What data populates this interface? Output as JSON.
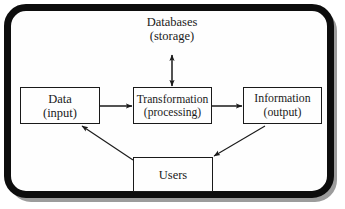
{
  "diagram": {
    "type": "flow-diagram",
    "background_color": "#fefefe",
    "frame_color": "#0d0d0d",
    "line_color": "#1a1a1a",
    "nodes": [
      {
        "id": "databases",
        "label_line1": "Databases",
        "label_line2": "(storage)",
        "boxed": false
      },
      {
        "id": "data",
        "label_line1": "Data",
        "label_line2": "(input)",
        "boxed": true
      },
      {
        "id": "transformation",
        "label_line1": "Transformation",
        "label_line2": "(processing)",
        "boxed": true
      },
      {
        "id": "information",
        "label_line1": "Information",
        "label_line2": "(output)",
        "boxed": true
      },
      {
        "id": "users",
        "label_line1": "Users",
        "label_line2": "",
        "boxed": true
      }
    ],
    "edges": [
      {
        "from": "data",
        "to": "transformation",
        "style": "solid",
        "arrowheads": "single"
      },
      {
        "from": "transformation",
        "to": "information",
        "style": "solid",
        "arrowheads": "single"
      },
      {
        "from": "databases",
        "to": "transformation",
        "style": "solid",
        "arrowheads": "double"
      },
      {
        "from": "information",
        "to": "users",
        "style": "solid",
        "arrowheads": "single"
      },
      {
        "from": "users",
        "to": "data",
        "style": "solid",
        "arrowheads": "single"
      }
    ]
  }
}
